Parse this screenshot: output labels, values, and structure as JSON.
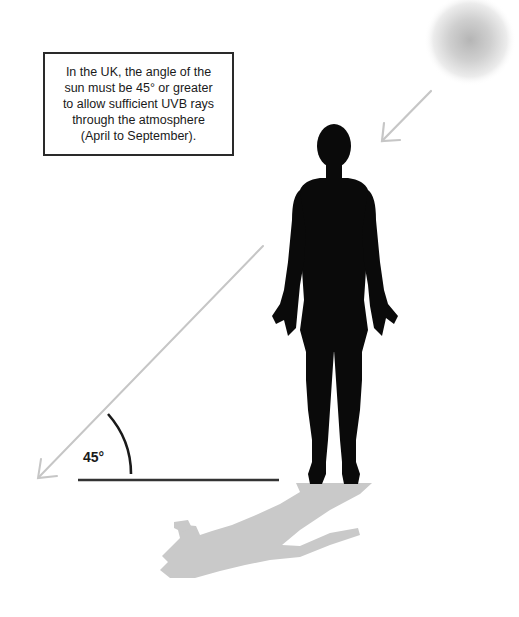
{
  "info_box": {
    "lines": [
      "In the UK, the angle of the",
      "sun must be 45° or greater",
      "to allow sufficient UVB rays",
      "through the atmosphere",
      "(April to September)."
    ]
  },
  "angle": {
    "label": "45°",
    "degrees": 45
  },
  "elements": {
    "sun": "sun-icon",
    "person": "human-silhouette",
    "shadow": "shadow",
    "sun_ray_short": "arrow-short",
    "sun_ray_long": "arrow-long",
    "ground": "ground-line",
    "arc": "angle-arc"
  },
  "colors": {
    "silhouette": "#0a0a0a",
    "shadow": "#c8c8c8",
    "arrow": "#c4c4c4",
    "sun_center": "#b8b8b8",
    "ground": "#333333",
    "text": "#1a1a1a"
  }
}
